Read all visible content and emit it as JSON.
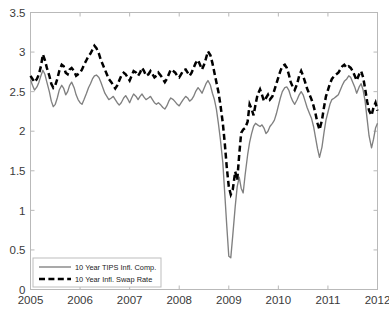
{
  "chart_data": {
    "type": "line",
    "title": "",
    "xlabel": "",
    "ylabel": "",
    "xlim": [
      2005.0,
      2012.0
    ],
    "ylim": [
      0,
      3.5
    ],
    "grid": false,
    "legend_position": "lower left",
    "xticks": [
      "2005",
      "2006",
      "2007",
      "2008",
      "2009",
      "2010",
      "2011",
      "2012"
    ],
    "xtick_values": [
      2005,
      2006,
      2007,
      2008,
      2009,
      2010,
      2011,
      2012
    ],
    "yticks": [
      "0",
      "0.5",
      "1",
      "1.5",
      "2",
      "2.5",
      "3",
      "3.5"
    ],
    "ytick_values": [
      0,
      0.5,
      1,
      1.5,
      2,
      2.5,
      3,
      3.5
    ],
    "series": [
      {
        "name": "10 Year TIPS Infl. Comp.",
        "style": "solid",
        "color": "#808080",
        "x": [
          2005.0,
          2005.04,
          2005.08,
          2005.13,
          2005.17,
          2005.21,
          2005.25,
          2005.29,
          2005.33,
          2005.38,
          2005.42,
          2005.46,
          2005.5,
          2005.54,
          2005.58,
          2005.63,
          2005.67,
          2005.71,
          2005.75,
          2005.79,
          2005.83,
          2005.88,
          2005.92,
          2005.96,
          2006.0,
          2006.04,
          2006.08,
          2006.13,
          2006.17,
          2006.21,
          2006.25,
          2006.29,
          2006.33,
          2006.38,
          2006.42,
          2006.46,
          2006.5,
          2006.54,
          2006.58,
          2006.63,
          2006.67,
          2006.71,
          2006.75,
          2006.79,
          2006.83,
          2006.88,
          2006.92,
          2006.96,
          2007.0,
          2007.04,
          2007.08,
          2007.13,
          2007.17,
          2007.21,
          2007.25,
          2007.29,
          2007.33,
          2007.38,
          2007.42,
          2007.46,
          2007.5,
          2007.54,
          2007.58,
          2007.63,
          2007.67,
          2007.71,
          2007.75,
          2007.79,
          2007.83,
          2007.88,
          2007.92,
          2007.96,
          2008.0,
          2008.04,
          2008.08,
          2008.13,
          2008.17,
          2008.21,
          2008.25,
          2008.29,
          2008.33,
          2008.38,
          2008.42,
          2008.46,
          2008.5,
          2008.54,
          2008.58,
          2008.63,
          2008.67,
          2008.71,
          2008.75,
          2008.79,
          2008.83,
          2008.88,
          2008.92,
          2008.96,
          2009.0,
          2009.04,
          2009.08,
          2009.13,
          2009.17,
          2009.21,
          2009.25,
          2009.29,
          2009.33,
          2009.38,
          2009.42,
          2009.46,
          2009.5,
          2009.54,
          2009.58,
          2009.63,
          2009.67,
          2009.71,
          2009.75,
          2009.79,
          2009.83,
          2009.88,
          2009.92,
          2009.96,
          2010.0,
          2010.04,
          2010.08,
          2010.13,
          2010.17,
          2010.21,
          2010.25,
          2010.29,
          2010.33,
          2010.38,
          2010.42,
          2010.46,
          2010.5,
          2010.54,
          2010.58,
          2010.63,
          2010.67,
          2010.71,
          2010.75,
          2010.79,
          2010.83,
          2010.88,
          2010.92,
          2010.96,
          2011.0,
          2011.04,
          2011.08,
          2011.13,
          2011.17,
          2011.21,
          2011.25,
          2011.29,
          2011.33,
          2011.38,
          2011.42,
          2011.46,
          2011.5,
          2011.54,
          2011.58,
          2011.63,
          2011.67,
          2011.71,
          2011.75,
          2011.79,
          2011.83,
          2011.88,
          2011.92,
          2011.96,
          2012.0
        ],
        "y": [
          2.65,
          2.58,
          2.52,
          2.56,
          2.62,
          2.7,
          2.77,
          2.72,
          2.62,
          2.5,
          2.38,
          2.31,
          2.34,
          2.42,
          2.52,
          2.58,
          2.54,
          2.46,
          2.5,
          2.58,
          2.62,
          2.55,
          2.46,
          2.4,
          2.36,
          2.34,
          2.4,
          2.48,
          2.55,
          2.6,
          2.66,
          2.7,
          2.71,
          2.68,
          2.62,
          2.55,
          2.48,
          2.44,
          2.4,
          2.42,
          2.44,
          2.4,
          2.36,
          2.33,
          2.36,
          2.42,
          2.45,
          2.41,
          2.36,
          2.42,
          2.47,
          2.44,
          2.4,
          2.44,
          2.47,
          2.43,
          2.4,
          2.42,
          2.44,
          2.4,
          2.36,
          2.34,
          2.36,
          2.33,
          2.3,
          2.28,
          2.32,
          2.38,
          2.42,
          2.4,
          2.37,
          2.34,
          2.32,
          2.36,
          2.4,
          2.44,
          2.42,
          2.38,
          2.4,
          2.44,
          2.5,
          2.55,
          2.52,
          2.48,
          2.54,
          2.6,
          2.64,
          2.58,
          2.48,
          2.4,
          2.28,
          2.1,
          1.9,
          1.6,
          1.2,
          0.8,
          0.42,
          0.4,
          0.68,
          1.05,
          1.3,
          1.42,
          1.28,
          1.22,
          1.45,
          1.7,
          1.86,
          1.97,
          2.06,
          2.1,
          2.08,
          2.06,
          2.08,
          2.04,
          1.97,
          2.0,
          2.06,
          2.1,
          2.14,
          2.22,
          2.32,
          2.42,
          2.5,
          2.55,
          2.56,
          2.52,
          2.44,
          2.38,
          2.34,
          2.4,
          2.46,
          2.5,
          2.46,
          2.38,
          2.3,
          2.22,
          2.16,
          2.06,
          1.92,
          1.78,
          1.67,
          1.8,
          1.98,
          2.14,
          2.24,
          2.34,
          2.4,
          2.42,
          2.44,
          2.46,
          2.52,
          2.58,
          2.63,
          2.66,
          2.7,
          2.68,
          2.62,
          2.56,
          2.48,
          2.56,
          2.6,
          2.52,
          2.38,
          2.16,
          1.94,
          1.79,
          1.9,
          2.04,
          2.1
        ]
      },
      {
        "name": "10 Year Infl. Swap Rate",
        "style": "dashed",
        "color": "#000000",
        "x": [
          2005.0,
          2005.04,
          2005.08,
          2005.13,
          2005.17,
          2005.21,
          2005.25,
          2005.29,
          2005.33,
          2005.38,
          2005.42,
          2005.46,
          2005.5,
          2005.54,
          2005.58,
          2005.63,
          2005.67,
          2005.71,
          2005.75,
          2005.79,
          2005.83,
          2005.88,
          2005.92,
          2005.96,
          2006.0,
          2006.04,
          2006.08,
          2006.13,
          2006.17,
          2006.21,
          2006.25,
          2006.29,
          2006.33,
          2006.38,
          2006.42,
          2006.46,
          2006.5,
          2006.54,
          2006.58,
          2006.63,
          2006.67,
          2006.71,
          2006.75,
          2006.79,
          2006.83,
          2006.88,
          2006.92,
          2006.96,
          2007.0,
          2007.04,
          2007.08,
          2007.13,
          2007.17,
          2007.21,
          2007.25,
          2007.29,
          2007.33,
          2007.38,
          2007.42,
          2007.46,
          2007.5,
          2007.54,
          2007.58,
          2007.63,
          2007.67,
          2007.71,
          2007.75,
          2007.79,
          2007.83,
          2007.88,
          2007.92,
          2007.96,
          2008.0,
          2008.04,
          2008.08,
          2008.13,
          2008.17,
          2008.21,
          2008.25,
          2008.29,
          2008.33,
          2008.38,
          2008.42,
          2008.46,
          2008.5,
          2008.54,
          2008.58,
          2008.63,
          2008.67,
          2008.71,
          2008.75,
          2008.79,
          2008.83,
          2008.88,
          2008.92,
          2008.96,
          2009.0,
          2009.04,
          2009.08,
          2009.13,
          2009.17,
          2009.21,
          2009.25,
          2009.29,
          2009.33,
          2009.38,
          2009.42,
          2009.46,
          2009.5,
          2009.54,
          2009.58,
          2009.63,
          2009.67,
          2009.71,
          2009.75,
          2009.79,
          2009.83,
          2009.88,
          2009.92,
          2009.96,
          2010.0,
          2010.04,
          2010.08,
          2010.13,
          2010.17,
          2010.21,
          2010.25,
          2010.29,
          2010.33,
          2010.38,
          2010.42,
          2010.46,
          2010.5,
          2010.54,
          2010.58,
          2010.63,
          2010.67,
          2010.71,
          2010.75,
          2010.79,
          2010.83,
          2010.88,
          2010.92,
          2010.96,
          2011.0,
          2011.04,
          2011.08,
          2011.13,
          2011.17,
          2011.21,
          2011.25,
          2011.29,
          2011.33,
          2011.38,
          2011.42,
          2011.46,
          2011.5,
          2011.54,
          2011.58,
          2011.63,
          2011.67,
          2011.71,
          2011.75,
          2011.79,
          2011.83,
          2011.88,
          2011.92,
          2011.96,
          2012.0
        ],
        "y": [
          2.7,
          2.66,
          2.62,
          2.66,
          2.72,
          2.82,
          2.97,
          2.9,
          2.8,
          2.7,
          2.6,
          2.55,
          2.58,
          2.66,
          2.76,
          2.84,
          2.82,
          2.74,
          2.72,
          2.78,
          2.8,
          2.76,
          2.7,
          2.72,
          2.74,
          2.78,
          2.84,
          2.9,
          2.95,
          2.98,
          3.03,
          3.08,
          3.05,
          2.98,
          2.9,
          2.84,
          2.78,
          2.72,
          2.66,
          2.62,
          2.58,
          2.54,
          2.58,
          2.64,
          2.7,
          2.74,
          2.72,
          2.68,
          2.64,
          2.7,
          2.76,
          2.74,
          2.7,
          2.74,
          2.8,
          2.76,
          2.7,
          2.72,
          2.76,
          2.72,
          2.68,
          2.7,
          2.74,
          2.7,
          2.66,
          2.62,
          2.66,
          2.72,
          2.78,
          2.76,
          2.74,
          2.7,
          2.68,
          2.72,
          2.77,
          2.78,
          2.74,
          2.7,
          2.74,
          2.8,
          2.86,
          2.9,
          2.84,
          2.78,
          2.84,
          2.92,
          3.01,
          2.96,
          2.86,
          2.74,
          2.62,
          2.5,
          2.34,
          2.1,
          1.84,
          1.54,
          1.3,
          1.2,
          1.26,
          1.49,
          1.38,
          1.7,
          1.98,
          2.02,
          2.04,
          2.12,
          2.34,
          2.28,
          2.2,
          2.34,
          2.46,
          2.53,
          2.46,
          2.38,
          2.42,
          2.46,
          2.4,
          2.44,
          2.52,
          2.6,
          2.68,
          2.76,
          2.82,
          2.84,
          2.8,
          2.72,
          2.62,
          2.56,
          2.52,
          2.6,
          2.7,
          2.76,
          2.7,
          2.62,
          2.54,
          2.46,
          2.4,
          2.32,
          2.22,
          2.1,
          2.02,
          2.14,
          2.3,
          2.44,
          2.52,
          2.6,
          2.66,
          2.7,
          2.72,
          2.74,
          2.78,
          2.82,
          2.84,
          2.8,
          2.82,
          2.8,
          2.76,
          2.7,
          2.64,
          2.72,
          2.76,
          2.68,
          2.54,
          2.38,
          2.26,
          2.2,
          2.3,
          2.36,
          2.26
        ]
      }
    ]
  },
  "legend": {
    "entries": [
      {
        "label": "10 Year TIPS Infl. Comp."
      },
      {
        "label": "10 Year Infl. Swap Rate"
      }
    ]
  },
  "colors": {
    "tips_line": "#808080",
    "swap_line": "#000000",
    "axis": "#b9b9b9",
    "tick_text": "#3a3a3a",
    "background": "#ffffff"
  }
}
